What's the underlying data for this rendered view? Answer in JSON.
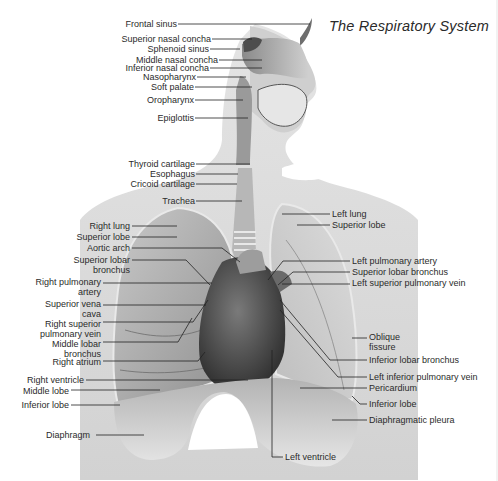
{
  "diagram": {
    "title": "The Respiratory System",
    "colors": {
      "background": "#ffffff",
      "body_silhouette": "#dcdcdc",
      "lung": "#b9b9b9",
      "lung_dark": "#8e8e8e",
      "heart": "#4a4a4a",
      "diaphragm": "#a8a8a8",
      "trachea": "#c8c8c8",
      "leader_line": "#222222",
      "label_text": "#2b2b2b"
    },
    "labels_left": [
      {
        "id": "frontal-sinus",
        "text": "Frontal sinus",
        "x": 0,
        "y": 20,
        "w": 177,
        "line": [
          178,
          24,
          310,
          24
        ]
      },
      {
        "id": "superior-nasal-concha",
        "text": "Superior nasal concha",
        "x": 0,
        "y": 35,
        "w": 211,
        "line": [
          212,
          39,
          252,
          39
        ]
      },
      {
        "id": "sphenoid-sinus",
        "text": "Sphenoid sinus",
        "x": 0,
        "y": 45,
        "w": 209,
        "line": [
          210,
          49,
          240,
          49
        ]
      },
      {
        "id": "middle-nasal-concha",
        "text": "Middle nasal concha",
        "x": 0,
        "y": 56,
        "w": 218,
        "line": [
          219,
          60,
          262,
          60
        ]
      },
      {
        "id": "inferior-nasal-concha",
        "text": "Inferior nasal concha",
        "x": 0,
        "y": 64,
        "w": 209,
        "line": [
          210,
          68,
          262,
          68
        ]
      },
      {
        "id": "nasopharynx",
        "text": "Nasopharynx",
        "x": 0,
        "y": 73,
        "w": 196,
        "line": [
          197,
          77,
          246,
          77
        ]
      },
      {
        "id": "soft-palate",
        "text": "Soft palate",
        "x": 0,
        "y": 83,
        "w": 194,
        "line": [
          195,
          87,
          252,
          87
        ]
      },
      {
        "id": "oropharynx",
        "text": "Oropharynx",
        "x": 0,
        "y": 96,
        "w": 194,
        "line": [
          195,
          100,
          243,
          100
        ]
      },
      {
        "id": "epiglottis",
        "text": "Epiglottis",
        "x": 0,
        "y": 114,
        "w": 194,
        "line": [
          195,
          118,
          248,
          118
        ]
      },
      {
        "id": "thyroid-cartilage",
        "text": "Thyroid cartilage",
        "x": 0,
        "y": 160,
        "w": 195,
        "line": [
          196,
          164,
          250,
          164
        ]
      },
      {
        "id": "esophagus",
        "text": "Esophagus",
        "x": 0,
        "y": 170,
        "w": 195,
        "line": [
          196,
          174,
          238,
          174
        ]
      },
      {
        "id": "cricoid-cartilage",
        "text": "Cricoid cartilage",
        "x": 0,
        "y": 180,
        "w": 195,
        "line": [
          196,
          184,
          237,
          184
        ]
      },
      {
        "id": "trachea",
        "text": "Trachea",
        "x": 0,
        "y": 197,
        "w": 195,
        "line": [
          196,
          201,
          242,
          201
        ]
      },
      {
        "id": "right-lung",
        "text": "Right lung",
        "x": 0,
        "y": 222,
        "w": 130,
        "line": [
          132,
          226,
          177,
          226
        ]
      },
      {
        "id": "superior-lobe-right",
        "text": "Superior lobe",
        "x": 0,
        "y": 233,
        "w": 130,
        "line": [
          132,
          237,
          177,
          237
        ]
      },
      {
        "id": "aortic-arch",
        "text": "Aortic arch",
        "x": 0,
        "y": 244,
        "w": 130,
        "line": [
          132,
          248,
          222,
          248,
          240,
          262
        ]
      },
      {
        "id": "superior-lobar-bronchus-right",
        "text": "Superior lobar\nbronchus",
        "x": 0,
        "y": 256,
        "w": 130,
        "line": [
          132,
          260,
          186,
          260,
          210,
          285
        ]
      },
      {
        "id": "right-pulmonary-artery",
        "text": "Right pulmonary\nartery",
        "x": 0,
        "y": 278,
        "w": 101,
        "line": [
          103,
          283,
          212,
          283
        ]
      },
      {
        "id": "superior-vena-cava",
        "text": "Superior vena\ncava",
        "x": 0,
        "y": 300,
        "w": 101,
        "line": [
          103,
          305,
          206,
          305
        ]
      },
      {
        "id": "right-superior-pulmonary-vein",
        "text": "Right superior\npulmonary vein",
        "x": 0,
        "y": 320,
        "w": 101,
        "line": [
          103,
          322,
          193,
          322,
          208,
          300
        ]
      },
      {
        "id": "middle-lobar-bronchus",
        "text": "Middle lobar\nbronchus",
        "x": 0,
        "y": 340,
        "w": 101,
        "line": [
          103,
          342,
          178,
          342,
          192,
          318
        ]
      },
      {
        "id": "right-atrium",
        "text": "Right atrium",
        "x": 0,
        "y": 358,
        "w": 101,
        "line": [
          103,
          361,
          198,
          361,
          205,
          352
        ]
      },
      {
        "id": "right-ventricle",
        "text": "Right ventricle",
        "x": 0,
        "y": 376,
        "w": 84,
        "line": [
          86,
          380,
          248,
          380
        ]
      },
      {
        "id": "middle-lobe",
        "text": "Middle lobe",
        "x": 0,
        "y": 387,
        "w": 69,
        "line": [
          71,
          390,
          160,
          390
        ]
      },
      {
        "id": "inferior-lobe-right",
        "text": "Inferior lobe",
        "x": 0,
        "y": 401,
        "w": 69,
        "line": [
          71,
          405,
          120,
          405
        ]
      },
      {
        "id": "diaphragm",
        "text": "Diaphragm",
        "x": 0,
        "y": 431,
        "w": 90,
        "line": [
          96,
          435,
          144,
          435
        ]
      }
    ],
    "labels_right": [
      {
        "id": "left-lung",
        "text": "Left lung",
        "x": 332,
        "y": 210,
        "line": [
          282,
          214,
          330,
          214
        ]
      },
      {
        "id": "superior-lobe-left",
        "text": "Superior lobe",
        "x": 332,
        "y": 221,
        "line": [
          297,
          225,
          330,
          225
        ]
      },
      {
        "id": "left-pulmonary-artery",
        "text": "Left pulmonary artery",
        "x": 352,
        "y": 257,
        "line": [
          268,
          280,
          283,
          261,
          350,
          261
        ]
      },
      {
        "id": "superior-lobar-bronchus-left",
        "text": "Superior lobar bronchus",
        "x": 352,
        "y": 268,
        "line": [
          278,
          285,
          293,
          272,
          350,
          272
        ]
      },
      {
        "id": "left-superior-pulmonary-vein",
        "text": "Left superior pulmonary vein",
        "x": 352,
        "y": 279,
        "line": [
          282,
          284,
          350,
          284
        ]
      },
      {
        "id": "oblique-fissure",
        "text": "Oblique\nfissure",
        "x": 369,
        "y": 333,
        "line": [
          352,
          338,
          367,
          338
        ]
      },
      {
        "id": "inferior-lobar-bronchus",
        "text": "Inferior lobar bronchus",
        "x": 369,
        "y": 356,
        "line": [
          280,
          300,
          330,
          360,
          367,
          360
        ]
      },
      {
        "id": "left-inferior-pulmonary-vein",
        "text": "Left inferior pulmonary vein",
        "x": 369,
        "y": 373,
        "line": [
          280,
          310,
          338,
          377,
          367,
          377
        ]
      },
      {
        "id": "pericardium",
        "text": "Pericardium",
        "x": 369,
        "y": 384,
        "line": [
          300,
          388,
          367,
          388
        ]
      },
      {
        "id": "inferior-lobe-left",
        "text": "Inferior lobe",
        "x": 369,
        "y": 400,
        "line": [
          352,
          396,
          360,
          404,
          367,
          404
        ]
      },
      {
        "id": "diaphragmatic-pleura",
        "text": "Diaphragmatic pleura",
        "x": 369,
        "y": 416,
        "line": [
          332,
          420,
          367,
          420
        ]
      },
      {
        "id": "left-ventricle",
        "text": "Left ventricle",
        "x": 285,
        "y": 453,
        "line": [
          272,
          350,
          272,
          457,
          283,
          457
        ]
      }
    ]
  }
}
